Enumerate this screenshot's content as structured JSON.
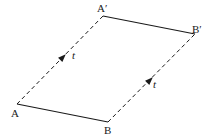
{
  "diagram": {
    "type": "parallelogram-translation",
    "colors": {
      "stroke": "#1a1a1a",
      "background": "#ffffff"
    },
    "vertices": {
      "A": {
        "label": "A",
        "x": 17,
        "y": 104
      },
      "B": {
        "label": "B",
        "x": 108,
        "y": 122
      },
      "A_prime": {
        "label": "A′",
        "x": 103,
        "y": 16
      },
      "B_prime": {
        "label": "B′",
        "x": 195,
        "y": 34
      }
    },
    "edges": [
      {
        "from": "A",
        "to": "B",
        "style": "solid"
      },
      {
        "from": "A_prime",
        "to": "B_prime",
        "style": "solid"
      },
      {
        "from": "A",
        "to": "A_prime",
        "style": "dashed",
        "arrow": true,
        "label": "t"
      },
      {
        "from": "B",
        "to": "B_prime",
        "style": "dashed",
        "arrow": true,
        "label": "t"
      }
    ],
    "vector_labels": {
      "left": "t",
      "right": "t"
    }
  }
}
